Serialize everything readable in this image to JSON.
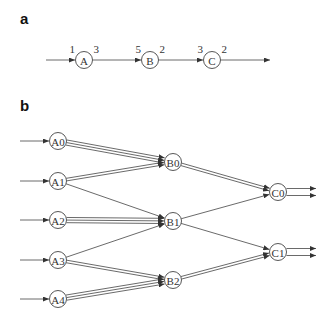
{
  "panels": {
    "a": {
      "label": "a",
      "nodes": [
        {
          "id": "A",
          "label": "A",
          "x": 84,
          "y": 60,
          "in": "1",
          "out": "3"
        },
        {
          "id": "B",
          "label": "B",
          "x": 150,
          "y": 60,
          "in": "5",
          "out": "2"
        },
        {
          "id": "C",
          "label": "C",
          "x": 212,
          "y": 60,
          "in": "3",
          "out": "2"
        }
      ],
      "input_start_x": 46,
      "output_end_x": 270
    },
    "b": {
      "label": "b",
      "nodes": [
        {
          "id": "A0",
          "label": "A0",
          "x": 58,
          "y": 141
        },
        {
          "id": "A1",
          "label": "A1",
          "x": 58,
          "y": 181
        },
        {
          "id": "A2",
          "label": "A2",
          "x": 58,
          "y": 220
        },
        {
          "id": "A3",
          "label": "A3",
          "x": 58,
          "y": 260
        },
        {
          "id": "A4",
          "label": "A4",
          "x": 58,
          "y": 299
        },
        {
          "id": "B0",
          "label": "B0",
          "x": 173,
          "y": 162
        },
        {
          "id": "B1",
          "label": "B1",
          "x": 173,
          "y": 221
        },
        {
          "id": "B2",
          "label": "B2",
          "x": 173,
          "y": 280
        },
        {
          "id": "C0",
          "label": "C0",
          "x": 278,
          "y": 192
        },
        {
          "id": "C1",
          "label": "C1",
          "x": 278,
          "y": 252
        }
      ],
      "inputs": [
        "A0",
        "A1",
        "A2",
        "A3",
        "A4"
      ],
      "edges": [
        {
          "from": "A0",
          "to": "B0",
          "count": 3
        },
        {
          "from": "A1",
          "to": "B0",
          "count": 2
        },
        {
          "from": "A1",
          "to": "B1",
          "count": 1
        },
        {
          "from": "A2",
          "to": "B1",
          "count": 3
        },
        {
          "from": "A3",
          "to": "B1",
          "count": 1
        },
        {
          "from": "A3",
          "to": "B2",
          "count": 2
        },
        {
          "from": "A4",
          "to": "B2",
          "count": 3
        },
        {
          "from": "B0",
          "to": "C0",
          "count": 2
        },
        {
          "from": "B1",
          "to": "C0",
          "count": 1
        },
        {
          "from": "B1",
          "to": "C1",
          "count": 1
        },
        {
          "from": "B2",
          "to": "C1",
          "count": 2
        }
      ],
      "outputs": [
        {
          "from": "C0",
          "count": 2
        },
        {
          "from": "C1",
          "count": 2
        }
      ]
    }
  }
}
